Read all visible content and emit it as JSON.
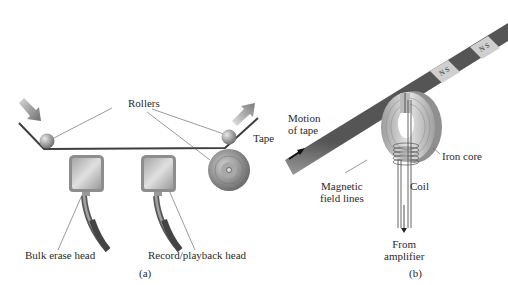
{
  "figure_a": {
    "caption": "(a)",
    "labels": {
      "rollers": "Rollers",
      "tape": "Tape",
      "bulk_erase_head": "Bulk erase head",
      "record_playback_head": "Record/playback head"
    }
  },
  "figure_b": {
    "caption": "(b)",
    "labels": {
      "motion_line1": "Motion",
      "motion_line2": "of tape",
      "iron_core": "Iron core",
      "magnetic_line1": "Magnetic",
      "magnetic_line2": "field lines",
      "coil": "Coil",
      "from_line1": "From",
      "from_line2": "amplifier"
    },
    "magnet_poles": [
      "N",
      "S"
    ]
  },
  "colors": {
    "tape_dark": "#555555",
    "arrow": "#8a8a8a",
    "metal": "#b5b5b5",
    "cable": "#7a7a7a"
  }
}
